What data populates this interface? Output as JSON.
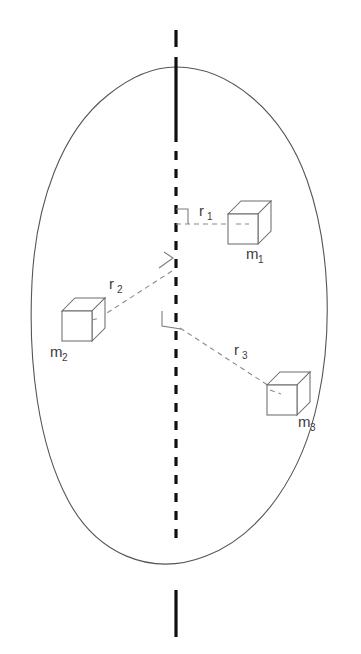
{
  "figure": {
    "background_color": "#ffffff",
    "width": 361,
    "height": 654
  },
  "axis": {
    "name": "rotation-axis",
    "color": "#111111",
    "top_solid": {
      "x": 176,
      "y1": 30,
      "y2": 47
    },
    "upper_solid": {
      "x": 176,
      "y1": 57,
      "y2": 133
    },
    "dashed": {
      "x": 176,
      "y1": 133,
      "y2": 546
    },
    "bottom_solid": {
      "x": 176,
      "y1": 590,
      "y2": 637
    }
  },
  "body_outline": {
    "name": "rigid-body-outline",
    "stroke_color": "#555555"
  },
  "masses": [
    {
      "id": "m1",
      "label": "m",
      "subscript": "1",
      "label_x": 246,
      "label_y": 259,
      "cube": {
        "x": 228,
        "y": 200,
        "size": 30,
        "depth": 13
      }
    },
    {
      "id": "m2",
      "label": "m",
      "subscript": "2",
      "label_x": 50,
      "label_y": 357,
      "cube": {
        "x": 62,
        "y": 297,
        "size": 30,
        "depth": 13
      }
    },
    {
      "id": "m3",
      "label": "m",
      "subscript": "3",
      "label_x": 298,
      "label_y": 427,
      "cube": {
        "x": 267,
        "y": 371,
        "size": 30,
        "depth": 13
      }
    }
  ],
  "radii": [
    {
      "id": "r1",
      "label": "r",
      "subscript": "1",
      "label_x": 199,
      "label_y": 216,
      "from": {
        "x": 176,
        "y": 224
      },
      "to": {
        "x": 240,
        "y": 224
      },
      "color": "#8a8a8a"
    },
    {
      "id": "r2",
      "label": "r",
      "subscript": "2",
      "label_x": 109,
      "label_y": 289,
      "from": {
        "x": 172,
        "y": 271
      },
      "to": {
        "x": 96,
        "y": 320
      },
      "color": "#8a8a8a"
    },
    {
      "id": "r3",
      "label": "r",
      "subscript": "3",
      "label_x": 234,
      "label_y": 355,
      "from": {
        "x": 180,
        "y": 328
      },
      "to": {
        "x": 272,
        "y": 388
      },
      "color": "#8a8a8a"
    }
  ],
  "right_angle_markers": [
    {
      "id": "right-angle-r1",
      "points": "176,209 188,209 188,224"
    },
    {
      "id": "right-angle-r2",
      "points": "164,254 172,259 158,269"
    },
    {
      "id": "right-angle-r3",
      "points": "163,312 163,325 180,328"
    }
  ]
}
